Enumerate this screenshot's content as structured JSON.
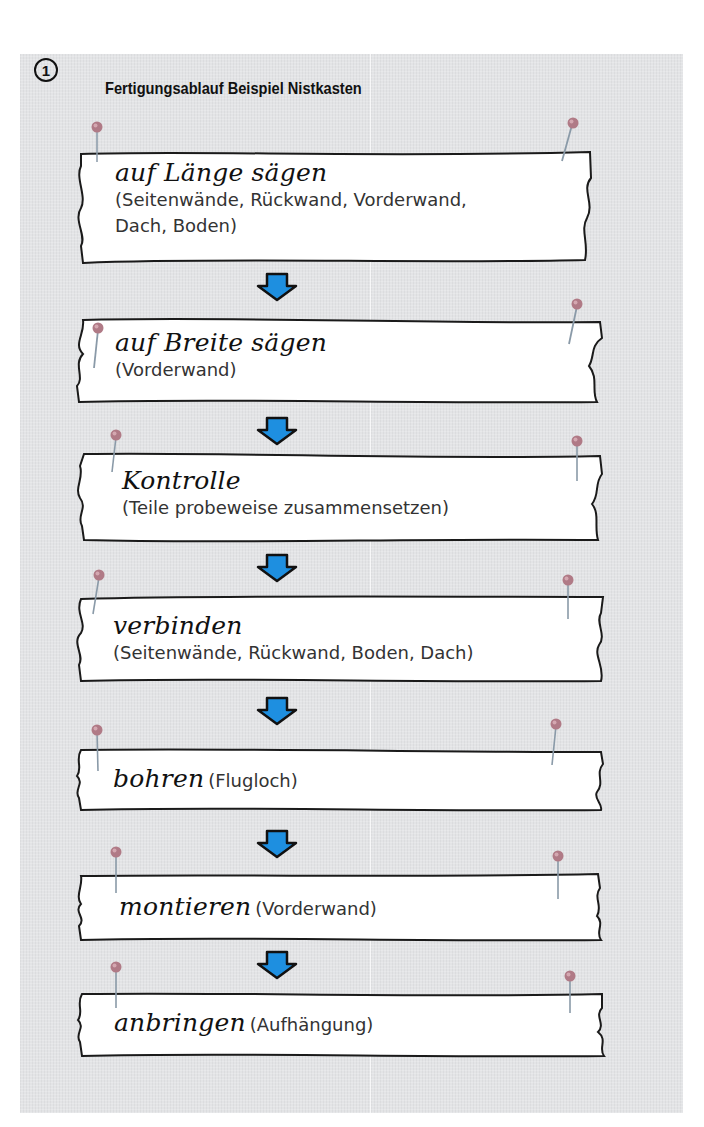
{
  "figure": {
    "number": "1",
    "title": "Fertigungsablauf Beispiel Nistkasten",
    "colors": {
      "background": "#e3e4e6",
      "paper": "#ffffff",
      "arrow_fill": "#1e8fe0",
      "arrow_stroke": "#111111",
      "pin_head": "#b07a86"
    }
  },
  "steps": [
    {
      "heading": "auf Länge sägen",
      "detail": "(Seitenwände, Rückwand, Vorderwand, Dach, Boden)",
      "detail_line1": "(Seitenwände, Rückwand, Vorderwand,",
      "detail_line2": "Dach, Boden)"
    },
    {
      "heading": "auf Breite sägen",
      "detail": "(Vorderwand)"
    },
    {
      "heading": "Kontrolle",
      "detail": "(Teile probeweise zusammensetzen)"
    },
    {
      "heading": "verbinden",
      "detail": "(Seitenwände, Rückwand, Boden, Dach)"
    },
    {
      "heading": "bohren",
      "detail": "(Flugloch)"
    },
    {
      "heading": "montieren",
      "detail": "(Vorderwand)"
    },
    {
      "heading": "anbringen",
      "detail": "(Aufhängung)"
    }
  ],
  "arrows": {
    "count": 6,
    "icon": "down-arrow-icon"
  },
  "pins": {
    "icon": "pushpin-icon"
  }
}
